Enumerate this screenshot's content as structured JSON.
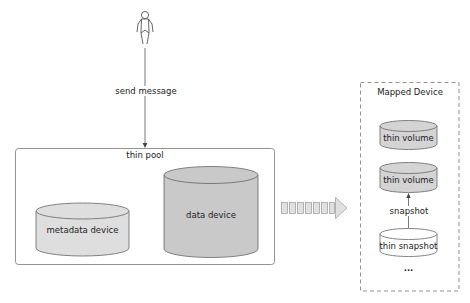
{
  "diagram": {
    "actor": {
      "icon": "person-icon"
    },
    "send_arrow": {
      "label": "send message"
    },
    "thin_pool": {
      "title": "thin pool",
      "metadata_device": {
        "label": "metadata device",
        "fill": "#dedede"
      },
      "data_device": {
        "label": "data device",
        "fill": "#c9c9c9"
      }
    },
    "map_arrow": {
      "icon": "dashed-block-arrow-icon",
      "fill": "#e0e0e0"
    },
    "mapped_device": {
      "title": "Mapped Device",
      "items": [
        {
          "label": "thin volume",
          "fill": "#d4d4d4"
        },
        {
          "label": "thin volume",
          "fill": "#d4d4d4"
        },
        {
          "label": "thin snapshot",
          "fill": "#ffffff"
        }
      ],
      "snapshot_arrow": {
        "label": "snapshot"
      },
      "ellipsis": "..."
    },
    "colors": {
      "stroke": "#555555",
      "pool_border": "#777777",
      "dashed_border": "#777777"
    }
  }
}
